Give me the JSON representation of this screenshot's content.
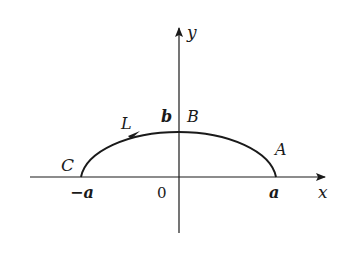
{
  "diagram": {
    "type": "coordinate-plot",
    "axes": {
      "x_label": "x",
      "y_label": "y",
      "origin_label": "0"
    },
    "ticks": {
      "neg_a": "−a",
      "pos_a": "a"
    },
    "points": {
      "C": "C",
      "B": "B",
      "A": "A",
      "b": "b"
    },
    "curve": {
      "name": "L",
      "direction": "left-to-right (C to B to A)"
    },
    "colors": {
      "stroke": "#1a1a1a",
      "background": "#ffffff"
    }
  }
}
